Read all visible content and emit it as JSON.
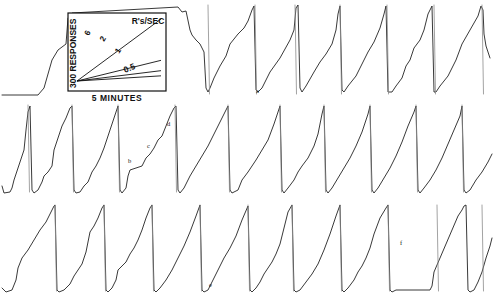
{
  "figure": {
    "title": "",
    "background_color": "#ffffff",
    "trace_color": "#222222",
    "width": 494,
    "height": 301
  },
  "legend": {
    "y_axis_label": "300 RESPONSES",
    "x_axis_label": "5 MINUTES",
    "rate_unit_label": "R's/SEC",
    "slope_labels": [
      "6",
      "2",
      "1",
      "0.5"
    ],
    "box": {
      "x": 68,
      "y": 13,
      "width": 98,
      "height": 78
    }
  },
  "annotations": [
    {
      "label": "a",
      "x": 256,
      "y": 93
    },
    {
      "label": "b",
      "x": 128,
      "y": 163
    },
    {
      "label": "c",
      "x": 147,
      "y": 148
    },
    {
      "label": "d",
      "x": 167,
      "y": 126
    },
    {
      "label": "e",
      "x": 209,
      "y": 287
    },
    {
      "label": "f",
      "x": 400,
      "y": 245
    }
  ],
  "chart_data": {
    "type": "line",
    "xlabel": "5 MINUTES",
    "ylabel": "300 RESPONSES",
    "grid": false,
    "legend_position": "inset-top-left",
    "rate_unit": "R's/SEC",
    "calibration_slopes": [
      6,
      2,
      1,
      0.5
    ],
    "rows": 3,
    "row_baselines_y": [
      95,
      193,
      292
    ],
    "row_tops_y": [
      5,
      105,
      205
    ],
    "series": [
      {
        "name": "row-1",
        "baseline_y": 95,
        "reset_x": [
          208,
          255,
          295,
          340,
          387,
          434,
          482
        ],
        "points": "2,95 38,95 44,88 52,60 58,50 62,47 66,44 68,18 72,13 178,7 182,12 186,11 190,30 192,35 196,40 200,44 204,52 206,88 208,92 210,88 214,78 220,66 226,56 230,44 238,34 244,28 248,21 252,10 254,6 256,90 258,92 262,88 270,72 280,58 290,40 294,30 296,8 298,5 300,88 302,92 306,86 314,72 320,62 326,54 332,44 336,30 338,14 340,6 342,90 344,92 348,86 356,76 362,64 368,52 374,42 380,28 384,14 386,6 388,92 392,92 396,86 402,78 406,66 410,60 414,48 420,40 424,30 428,14 432,6 434,92 436,92 440,86 448,76 456,60 462,44 470,30 478,16 481,6 483,10 484,34 486,46 490,58"
      },
      {
        "name": "row-2",
        "baseline_y": 193,
        "reset_x": [
          28,
          72,
          118,
          175,
          228,
          280,
          324,
          370,
          416,
          462
        ],
        "points": "2,186 4,193 10,192 12,188 14,180 18,168 24,150 26,130 28,112 30,106 32,190 34,193 38,190 42,182 44,176 48,172 52,166 54,150 58,138 62,126 66,118 70,108 72,106 74,190 76,193 80,192 84,186 88,182 92,172 96,166 100,158 104,148 108,136 112,124 116,112 118,106 120,190 122,193 126,188 128,176 130,170 136,168 142,166 146,158 150,154 154,148 158,140 162,136 166,126 170,116 174,108 176,106 178,190 180,193 184,188 190,176 196,166 202,156 208,146 214,134 220,122 226,110 228,106 230,190 232,193 238,190 242,180 248,172 252,166 256,160 262,150 268,140 274,124 278,112 280,106 282,190 284,193 288,188 294,180 298,172 302,166 308,158 314,146 318,134 322,114 324,106 326,190 328,193 332,188 338,178 344,168 350,158 356,146 362,132 368,114 370,106 372,190 374,193 378,188 384,178 390,168 396,156 402,142 408,126 414,112 416,106 418,190 420,193 424,188 430,180 436,170 442,158 448,144 454,130 460,116 462,106 464,190 466,193 470,190 476,180 482,172 488,162 492,154"
      },
      {
        "name": "row-3",
        "baseline_y": 292,
        "reset_x": [
          55,
          104,
          152,
          200,
          248,
          292,
          340,
          388,
          437,
          482
        ],
        "points": "2,288 6,292 12,290 16,280 18,268 22,258 28,250 34,240 40,230 46,222 50,214 54,206 55,205 57,290 59,292 64,290 70,284 74,276 78,270 82,264 86,252 88,242 90,232 94,226 98,218 102,208 104,205 106,290 108,292 112,288 116,280 118,270 122,266 126,262 130,254 134,248 138,240 142,230 146,218 150,208 152,205 154,290 156,292 160,288 166,280 172,270 178,258 184,246 190,232 196,216 200,205 202,290 204,292 208,290 212,282 216,274 220,266 224,258 230,248 236,236 242,220 248,206 250,290 252,292 256,288 260,282 264,274 268,268 272,262 276,254 280,244 284,228 288,212 292,205 294,290 296,292 300,290 306,282 312,274 318,264 324,250 330,234 336,216 340,205 342,290 344,292 348,288 354,280 358,272 362,266 366,258 370,248 374,234 380,218 386,208 388,205 390,290 392,292 396,290 402,290 430,290 432,286 434,272 440,258 446,244 452,230 458,216 462,210 464,206 466,205 468,290 470,292 474,290 478,282 482,272 486,258 490,246 492,238"
      }
    ]
  }
}
